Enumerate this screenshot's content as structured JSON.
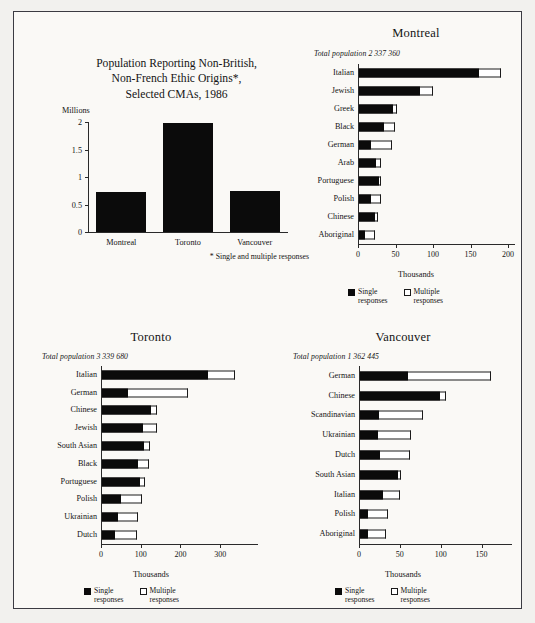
{
  "figure": {
    "title_lines": [
      "Population Reporting Non-British,",
      "Non-French Ethic Origins*,",
      "Selected CMAs, 1986"
    ],
    "footnote": "* Single and multiple responses",
    "legend": {
      "single_line1": "Single",
      "single_line2": "responses",
      "multi_line1": "Multiple",
      "multi_line2": "responses"
    },
    "axis_title_thousands": "Thousands",
    "axis_title_millions": "Millions"
  },
  "chart_data": [
    {
      "type": "bar",
      "id": "overview",
      "title": "Population Reporting Non-British, Non-French Ethic Origins*, Selected CMAs, 1986",
      "orientation": "vertical",
      "xlabel": "",
      "ylabel": "Millions",
      "categories": [
        "Montreal",
        "Toronto",
        "Vancouver"
      ],
      "values": [
        0.73,
        1.99,
        0.75
      ],
      "ylim": [
        0,
        2
      ],
      "yticks": [
        0,
        0.5,
        1,
        1.5,
        2
      ],
      "ytick_labels": [
        "0",
        "0.5",
        "1",
        "1.5",
        "2"
      ],
      "grid": false,
      "legend_position": "none",
      "annotation": "* Single and multiple responses"
    },
    {
      "type": "bar",
      "id": "montreal",
      "title": "Montreal",
      "subtitle": "Total population 2 337 360",
      "orientation": "horizontal",
      "stacked": true,
      "xlabel": "Thousands",
      "ylabel": "",
      "xlim": [
        0,
        200
      ],
      "xticks": [
        0,
        50,
        100,
        150,
        200
      ],
      "xtick_labels": [
        "0",
        "50",
        "100",
        "150",
        "200"
      ],
      "categories": [
        "Italian",
        "Jewish",
        "Greek",
        "Black",
        "German",
        "Arab",
        "Portuguese",
        "Polish",
        "Chinese",
        "Aboriginal"
      ],
      "series": [
        {
          "name": "Single responses",
          "color": "#0b0b0b",
          "values": [
            161,
            83,
            47,
            35,
            17,
            24,
            28,
            17,
            22,
            9
          ]
        },
        {
          "name": "Multiple responses",
          "color": "#ffffff",
          "values": [
            29,
            17,
            5,
            14,
            28,
            6,
            2,
            13,
            4,
            14
          ]
        }
      ],
      "grid": false,
      "legend_position": "bottom"
    },
    {
      "type": "bar",
      "id": "toronto",
      "title": "Toronto",
      "subtitle": "Total population 3 339 680",
      "orientation": "horizontal",
      "stacked": true,
      "xlabel": "Thousands",
      "ylabel": "",
      "xlim": [
        0,
        350
      ],
      "xticks": [
        0,
        100,
        200,
        300
      ],
      "xtick_labels": [
        "0",
        "100",
        "200",
        "300"
      ],
      "categories": [
        "Italian",
        "German",
        "Chinese",
        "Jewish",
        "South Asian",
        "Black",
        "Portuguese",
        "Polish",
        "Ukrainian",
        "Dutch"
      ],
      "series": [
        {
          "name": "Single responses",
          "color": "#0b0b0b",
          "values": [
            270,
            69,
            127,
            106,
            108,
            92,
            99,
            50,
            42,
            35
          ]
        },
        {
          "name": "Multiple responses",
          "color": "#ffffff",
          "values": [
            67,
            151,
            13,
            35,
            15,
            30,
            13,
            53,
            50,
            55
          ]
        }
      ],
      "grid": false,
      "legend_position": "bottom"
    },
    {
      "type": "bar",
      "id": "vancouver",
      "title": "Vancouver",
      "subtitle": "Total population 1 362 445",
      "orientation": "horizontal",
      "stacked": true,
      "xlabel": "Thousands",
      "ylabel": "",
      "xlim": [
        0,
        175
      ],
      "xticks": [
        0,
        50,
        100,
        150
      ],
      "xtick_labels": [
        "0",
        "50",
        "100",
        "150"
      ],
      "categories": [
        "German",
        "Chinese",
        "Scandinavian",
        "Ukrainian",
        "Dutch",
        "South Asian",
        "Italian",
        "Polish",
        "Aboriginal"
      ],
      "series": [
        {
          "name": "Single responses",
          "color": "#0b0b0b",
          "values": [
            60,
            99,
            25,
            23,
            26,
            48,
            29,
            11,
            11
          ]
        },
        {
          "name": "Multiple responses",
          "color": "#ffffff",
          "values": [
            101,
            7,
            53,
            41,
            36,
            4,
            21,
            25,
            22
          ]
        }
      ],
      "grid": false,
      "legend_position": "bottom"
    }
  ]
}
